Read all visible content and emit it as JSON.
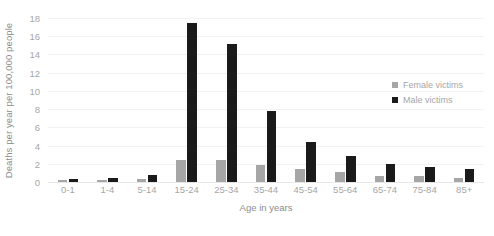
{
  "chart_data": {
    "type": "bar",
    "title": "",
    "xlabel": "Age in years",
    "ylabel": "Deaths per year per 100,000 people",
    "ylim": [
      0,
      18
    ],
    "yticks": [
      18,
      16,
      14,
      12,
      10,
      8,
      6,
      4,
      2,
      0
    ],
    "grid": true,
    "legend_position": "right",
    "categories": [
      "0-1",
      "1-4",
      "5-14",
      "15-24",
      "25-34",
      "35-44",
      "45-54",
      "55-64",
      "65-74",
      "75-84",
      "85+"
    ],
    "series": [
      {
        "name": "Female victims",
        "color": "#a6a6a6",
        "values": [
          0.2,
          0.2,
          0.3,
          2.4,
          2.4,
          1.9,
          1.4,
          1.1,
          0.7,
          0.7,
          0.4
        ]
      },
      {
        "name": "Male victims",
        "color": "#1a1a1a",
        "values": [
          0.3,
          0.4,
          0.8,
          17.4,
          15.1,
          7.8,
          4.4,
          2.9,
          2.0,
          1.7,
          1.4
        ]
      }
    ]
  },
  "axis": {
    "y_title": "Deaths per year per 100,000 people",
    "x_title": "Age in years"
  },
  "legend": {
    "items": [
      {
        "label": "Female victims",
        "swatch": "female-swatch-icon"
      },
      {
        "label": "Male victims",
        "swatch": "male-swatch-icon"
      }
    ]
  },
  "footer": {
    "cropped_text": ""
  },
  "colors": {
    "female": "#a6a6a6",
    "male": "#1a1a1a",
    "grid": "#f2f2f2",
    "axis_text": "#a6a6a6",
    "title_text": "#8c8c8c",
    "background": "#ffffff"
  }
}
